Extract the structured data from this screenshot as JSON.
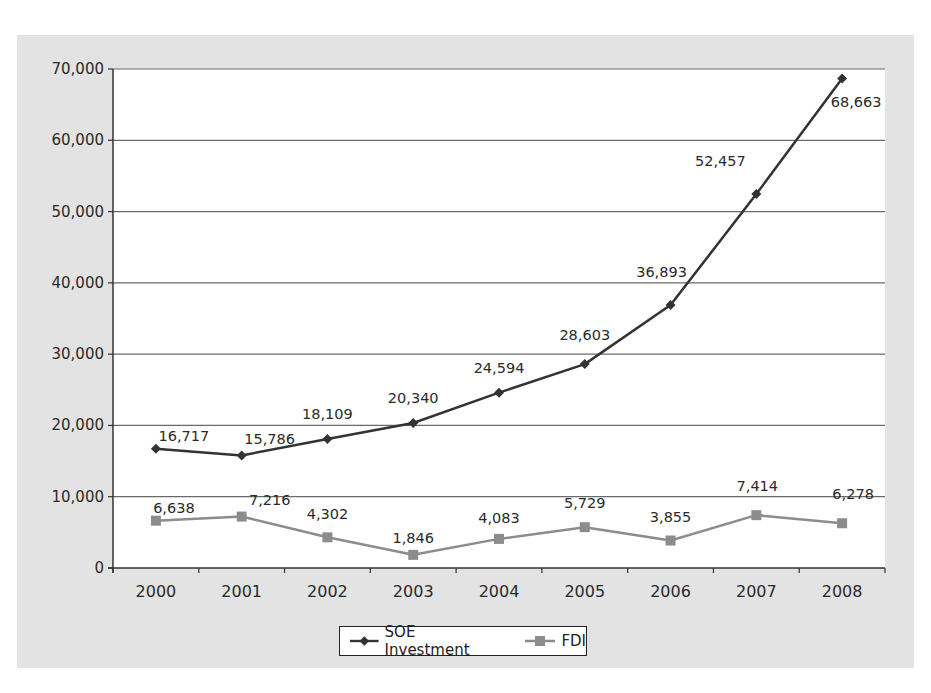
{
  "chart_data": {
    "type": "line",
    "title": "",
    "xlabel": "",
    "ylabel": "",
    "categories": [
      "2000",
      "2001",
      "2002",
      "2003",
      "2004",
      "2005",
      "2006",
      "2007",
      "2008"
    ],
    "series": [
      {
        "name": "SOE Investment",
        "color": "#333333",
        "marker": "diamond",
        "values": [
          16717,
          15786,
          18109,
          20340,
          24594,
          28603,
          36893,
          52457,
          68663
        ],
        "labels": [
          "16,717",
          "15,786",
          "18,109",
          "20,340",
          "24,594",
          "28,603",
          "36,893",
          "52,457",
          "68,663"
        ]
      },
      {
        "name": "FDI",
        "color": "#8c8c8c",
        "marker": "square",
        "values": [
          6638,
          7216,
          4302,
          1846,
          4083,
          5729,
          3855,
          7414,
          6278
        ],
        "labels": [
          "6,638",
          "7,216",
          "4,302",
          "1,846",
          "4,083",
          "5,729",
          "3,855",
          "7,414",
          "6,278"
        ]
      }
    ],
    "ylim": [
      0,
      70000
    ],
    "yticks": [
      0,
      10000,
      20000,
      30000,
      40000,
      50000,
      60000,
      70000
    ],
    "ytick_labels": [
      "0",
      "10,000",
      "20,000",
      "30,000",
      "40,000",
      "50,000",
      "60,000",
      "70,000"
    ],
    "grid": "horizontal",
    "legend_position": "bottom"
  },
  "legend": {
    "items": [
      {
        "label": "SOE Investment"
      },
      {
        "label": "FDI"
      }
    ]
  }
}
